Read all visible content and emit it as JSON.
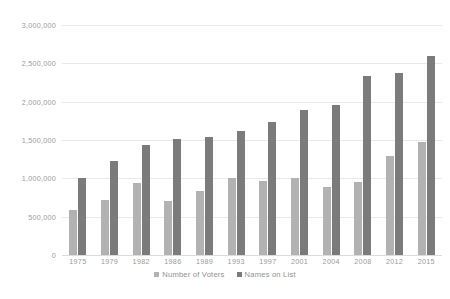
{
  "chart_data": {
    "type": "bar",
    "title": "",
    "xlabel": "",
    "ylabel": "",
    "categories": [
      "1975",
      "1979",
      "1982",
      "1986",
      "1989",
      "1993",
      "1997",
      "2001",
      "2004",
      "2008",
      "2012",
      "2015"
    ],
    "series": [
      {
        "name": "Number of Voters",
        "color": "#b2b2b2",
        "values": [
          590000,
          720000,
          940000,
          710000,
          840000,
          1000000,
          960000,
          1010000,
          890000,
          950000,
          1290000,
          1480000
        ]
      },
      {
        "name": "Names on List",
        "color": "#7b7b7b",
        "values": [
          1000000,
          1220000,
          1440000,
          1510000,
          1540000,
          1620000,
          1740000,
          1890000,
          1960000,
          2330000,
          2380000,
          2590000
        ]
      }
    ],
    "ylim": [
      0,
      3000000
    ],
    "ytick_values": [
      0,
      500000,
      1000000,
      1500000,
      2000000,
      2500000,
      3000000
    ],
    "ytick_labels": [
      "0",
      "500,000",
      "1,000,000",
      "1,500,000",
      "2,000,000",
      "2,500,000",
      "3,000,000"
    ],
    "grid": true,
    "legend_position": "bottom"
  },
  "legend": {
    "items": [
      {
        "label": "Number of Voters",
        "swatch_class": "voters"
      },
      {
        "label": "Names on List",
        "swatch_class": "names"
      }
    ]
  },
  "colors": {
    "background": "#ffffff",
    "gridline": "#e9e9e9",
    "axis": "#dcdcdc",
    "text": "#9a9a9a",
    "series_voters": "#b2b2b2",
    "series_names": "#7b7b7b"
  }
}
